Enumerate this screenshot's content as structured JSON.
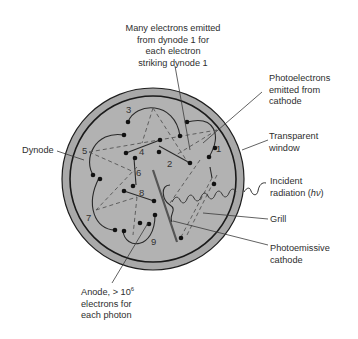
{
  "labels": {
    "many_electrons": [
      "Many electrons emitted",
      "from dynode 1 for",
      "each electron",
      "striking dynode 1"
    ],
    "photoelectrons": [
      "Photoelectrons",
      "emitted from",
      "cathode"
    ],
    "transparent_window": [
      "Transparent",
      "window"
    ],
    "dynode": "Dynode",
    "incident_radiation": [
      "Incident",
      "radiation (",
      "hν",
      ")"
    ],
    "grill": "Grill",
    "photoemissive_cathode": [
      "Photoemissive",
      "cathode"
    ],
    "anode": [
      "Anode, > 10",
      "6",
      "electrons for",
      "each photon"
    ]
  },
  "dynode_numbers": [
    "1",
    "2",
    "3",
    "4",
    "5",
    "6",
    "7",
    "8",
    "9"
  ],
  "colors": {
    "tube_fill": "#a9a9a9",
    "inner_fill": "#b3b3b3",
    "outline": "#1e1e1e",
    "leader": "#3a3a3a",
    "text": "#2e2e2e"
  }
}
